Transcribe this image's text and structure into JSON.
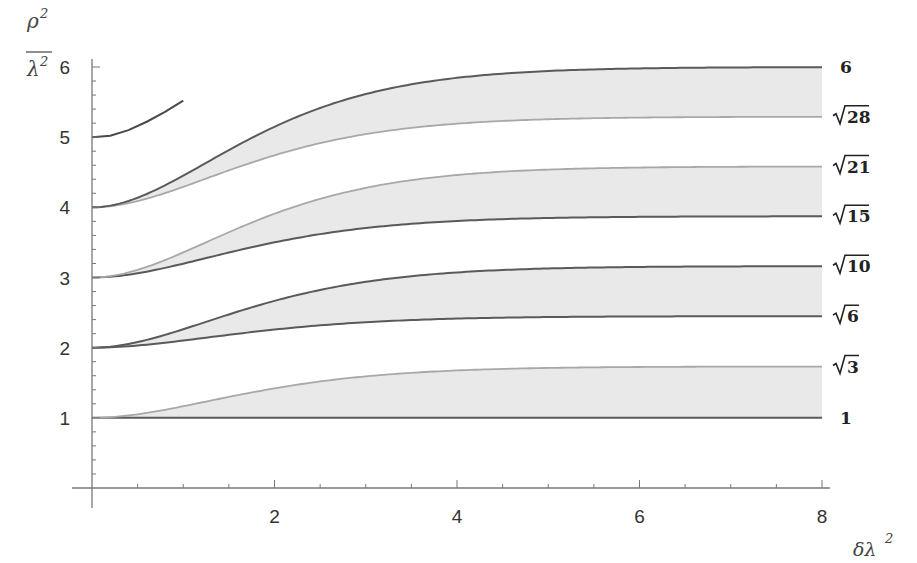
{
  "chart_data": {
    "type": "line",
    "title": "",
    "xlabel": "δλ²",
    "ylabel": "ρ²/λ²",
    "ylabel_parts": {
      "numerator": "ρ",
      "numerator_exp": "2",
      "denominator": "λ",
      "denominator_exp": "2"
    },
    "xlabel_parts": {
      "base": "δλ",
      "exp": "2"
    },
    "xlim": [
      0,
      8
    ],
    "ylim": [
      0,
      6
    ],
    "x_ticks": [
      2,
      4,
      6,
      8
    ],
    "x_tick_labels": [
      "2",
      "4",
      "6",
      "8"
    ],
    "y_ticks": [
      1,
      2,
      3,
      4,
      5,
      6
    ],
    "y_tick_labels": [
      "1",
      "2",
      "3",
      "4",
      "5",
      "6"
    ],
    "x_minor_step": 0.5,
    "y_minor_step": 0.2,
    "grid": false,
    "legend": "none",
    "colors": {
      "dark_curve": "#5a5a5a",
      "light_curve": "#a8a8a8",
      "band_fill": "#e9e9e9",
      "axis": "#777777"
    },
    "series": [
      {
        "name": "1",
        "label": "1",
        "start": 1,
        "asymptote": 1.0,
        "style": "dark"
      },
      {
        "name": "sqrt3",
        "label": "√3",
        "radicand": "3",
        "start": 1,
        "asymptote": 1.732,
        "style": "light"
      },
      {
        "name": "sqrt6",
        "label": "√6",
        "radicand": "6",
        "start": 2,
        "asymptote": 2.449,
        "style": "dark"
      },
      {
        "name": "sqrt10",
        "label": "√10",
        "radicand": "10",
        "start": 2,
        "asymptote": 3.162,
        "style": "dark"
      },
      {
        "name": "sqrt15",
        "label": "√15",
        "radicand": "15",
        "start": 3,
        "asymptote": 3.873,
        "style": "dark"
      },
      {
        "name": "sqrt21",
        "label": "√21",
        "radicand": "21",
        "start": 3,
        "asymptote": 4.583,
        "style": "light"
      },
      {
        "name": "sqrt28",
        "label": "√28",
        "radicand": "28",
        "start": 4,
        "asymptote": 5.292,
        "style": "light"
      },
      {
        "name": "6",
        "label": "6",
        "start": 4,
        "asymptote": 6.0,
        "style": "dark"
      }
    ],
    "bands": [
      {
        "lower": "1",
        "upper": "sqrt3"
      },
      {
        "lower": "sqrt6",
        "upper": "sqrt10"
      },
      {
        "lower": "sqrt15",
        "upper": "sqrt21"
      },
      {
        "lower": "sqrt28",
        "upper": "6"
      }
    ],
    "partial_curve": {
      "name": "n5-start",
      "x": [
        0,
        0.2,
        0.4,
        0.6,
        0.8,
        1.0
      ],
      "y": [
        5.0,
        5.02,
        5.1,
        5.22,
        5.36,
        5.52
      ]
    }
  }
}
